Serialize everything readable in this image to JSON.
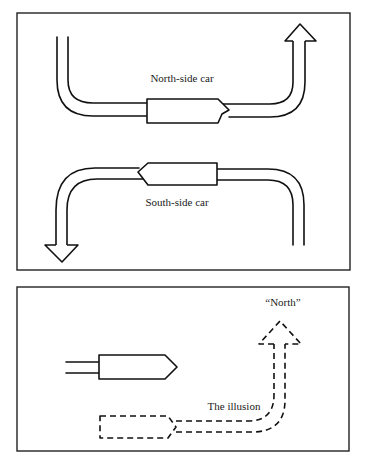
{
  "panels": [
    {
      "id": "top-panel",
      "labels": {
        "north_car": "North-side car",
        "south_car": "South-side car"
      }
    },
    {
      "id": "bottom-panel",
      "labels": {
        "north_target": "“North”",
        "illusion": "The illusion"
      }
    }
  ],
  "colors": {
    "stroke": "#111111",
    "background": "#ffffff"
  }
}
